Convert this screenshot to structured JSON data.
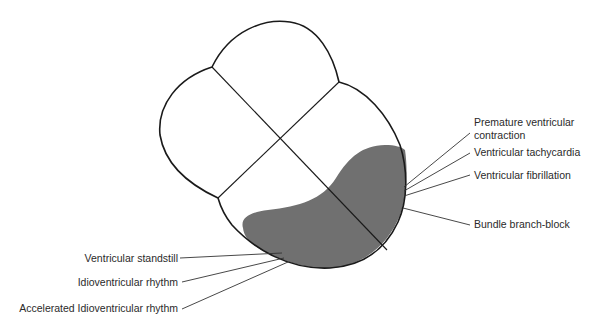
{
  "diagram": {
    "type": "heart-ventricle-regions",
    "colors": {
      "outline": "#1a1a1a",
      "shade": "#6e6e6e",
      "leader": "#333333",
      "text": "#2a2a2a"
    },
    "right_labels": [
      {
        "id": "pvc",
        "line1": "Premature ventricular",
        "line2": "contraction"
      },
      {
        "id": "vtach",
        "line1": "Ventricular tachycardia"
      },
      {
        "id": "vfib",
        "line1": "Ventricular fibrillation"
      },
      {
        "id": "bbb",
        "line1": "Bundle branch-block"
      }
    ],
    "left_labels": [
      {
        "id": "standstill",
        "line1": "Ventricular standstill"
      },
      {
        "id": "idio",
        "line1": "Idioventricular rhythm"
      },
      {
        "id": "accel",
        "line1": "Accelerated Idioventricular rhythm"
      }
    ]
  }
}
